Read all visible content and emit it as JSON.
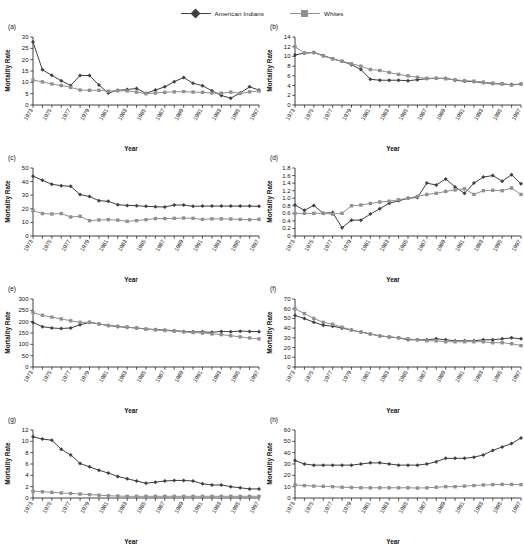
{
  "legend": {
    "entries": [
      {
        "label": "American Indians",
        "marker": "diamond",
        "color": "#3f3f46"
      },
      {
        "label": "Whites",
        "marker": "square",
        "color": "#8f8f96"
      }
    ]
  },
  "axis_titles": {
    "y": "Mortality Rate",
    "x": "Year"
  },
  "years": [
    1973,
    1974,
    1975,
    1976,
    1977,
    1978,
    1979,
    1980,
    1981,
    1982,
    1983,
    1984,
    1985,
    1986,
    1987,
    1988,
    1989,
    1990,
    1991,
    1992,
    1993,
    1994,
    1995,
    1996,
    1997
  ],
  "xtick_labels": [
    "1973",
    "1975",
    "1977",
    "1979",
    "1981",
    "1983",
    "1985",
    "1987",
    "1989",
    "1991",
    "1993",
    "1995",
    "1997"
  ],
  "chart_data": [
    {
      "type": "line",
      "tag": "(a)",
      "title": "",
      "xlabel": "Year",
      "ylabel": "Mortality Rate",
      "grid": false,
      "legend_position": "top-center",
      "xlim": [
        1973,
        1997
      ],
      "ylim": [
        0,
        30
      ],
      "yticks": [
        0,
        5,
        10,
        15,
        20,
        25,
        30
      ],
      "ytick_labels": [
        "0",
        "5",
        "10",
        "15",
        "20",
        "25",
        "30"
      ],
      "x": [
        1973,
        1974,
        1975,
        1976,
        1977,
        1978,
        1979,
        1980,
        1981,
        1982,
        1983,
        1984,
        1985,
        1986,
        1987,
        1988,
        1989,
        1990,
        1991,
        1992,
        1993,
        1994,
        1995,
        1996,
        1997
      ],
      "series": [
        {
          "name": "American Indians",
          "values": [
            27.8,
            15.5,
            13.1,
            10.7,
            8.6,
            13.0,
            13.0,
            8.8,
            5.3,
            6.5,
            6.8,
            7.3,
            5.2,
            6.6,
            8.0,
            10.3,
            12.1,
            9.6,
            8.5,
            6.3,
            4.2,
            3.0,
            5.3,
            8.0,
            6.6
          ]
        },
        {
          "name": "Whites",
          "values": [
            11.0,
            10.2,
            9.3,
            8.6,
            7.8,
            6.6,
            6.5,
            6.5,
            6.1,
            6.3,
            6.2,
            5.7,
            5.0,
            5.3,
            5.6,
            5.8,
            5.9,
            5.7,
            5.6,
            5.3,
            5.2,
            5.7,
            5.1,
            5.8,
            6.2
          ]
        }
      ]
    },
    {
      "type": "line",
      "tag": "(b)",
      "title": "",
      "xlabel": "Year",
      "ylabel": "Mortality Rate",
      "grid": false,
      "legend_position": "top-center",
      "xlim": [
        1973,
        1997
      ],
      "ylim": [
        0,
        14
      ],
      "yticks": [
        0,
        2,
        4,
        6,
        8,
        10,
        12,
        14
      ],
      "ytick_labels": [
        "0",
        "2",
        "4",
        "6",
        "8",
        "10",
        "12",
        "14"
      ],
      "x": [
        1973,
        1974,
        1975,
        1976,
        1977,
        1978,
        1979,
        1980,
        1981,
        1982,
        1983,
        1984,
        1985,
        1986,
        1987,
        1988,
        1989,
        1990,
        1991,
        1992,
        1993,
        1994,
        1995,
        1996,
        1997
      ],
      "series": [
        {
          "name": "American Indians",
          "values": [
            10.3,
            10.7,
            10.8,
            10.2,
            9.5,
            9.0,
            8.3,
            7.3,
            5.3,
            5.1,
            5.1,
            5.1,
            5.0,
            5.2,
            5.4,
            5.5,
            5.5,
            5.1,
            4.9,
            4.8,
            4.6,
            4.4,
            4.3,
            4.2,
            4.3
          ]
        },
        {
          "name": "Whites",
          "values": [
            12.0,
            10.7,
            10.8,
            10.1,
            9.5,
            9.0,
            8.5,
            8.0,
            7.3,
            7.1,
            6.7,
            6.3,
            6.0,
            5.7,
            5.5,
            5.5,
            5.4,
            5.2,
            5.0,
            4.9,
            4.7,
            4.5,
            4.4,
            4.1,
            4.3
          ]
        }
      ]
    },
    {
      "type": "line",
      "tag": "(c)",
      "title": "",
      "xlabel": "Year",
      "ylabel": "Mortality Rate",
      "grid": false,
      "legend_position": "top-center",
      "xlim": [
        1973,
        1997
      ],
      "ylim": [
        0,
        50
      ],
      "yticks": [
        0,
        10,
        20,
        30,
        40,
        50
      ],
      "ytick_labels": [
        "0",
        "10",
        "20",
        "30",
        "40",
        "50"
      ],
      "x": [
        1973,
        1974,
        1975,
        1976,
        1977,
        1978,
        1979,
        1980,
        1981,
        1982,
        1983,
        1984,
        1985,
        1986,
        1987,
        1988,
        1989,
        1990,
        1991,
        1992,
        1993,
        1994,
        1995,
        1996,
        1997
      ],
      "series": [
        {
          "name": "American Indians",
          "values": [
            44.0,
            41.0,
            38.0,
            37.0,
            36.5,
            30.5,
            29.0,
            26.0,
            25.5,
            23.0,
            22.5,
            22.3,
            21.8,
            21.5,
            21.3,
            22.8,
            22.8,
            21.8,
            22.0,
            22.0,
            22.0,
            22.0,
            22.0,
            22.0,
            21.8
          ]
        },
        {
          "name": "Whites",
          "values": [
            18.7,
            16.5,
            16.2,
            16.5,
            14.0,
            14.5,
            11.3,
            11.8,
            12.0,
            11.7,
            10.8,
            11.3,
            12.0,
            12.8,
            12.8,
            13.0,
            13.2,
            13.0,
            12.2,
            12.6,
            12.6,
            12.5,
            12.2,
            12.0,
            12.3
          ]
        }
      ]
    },
    {
      "type": "line",
      "tag": "(d)",
      "title": "",
      "xlabel": "Year",
      "ylabel": "Mortality Rate",
      "grid": false,
      "legend_position": "top-center",
      "xlim": [
        1973,
        1997
      ],
      "ylim": [
        0,
        1.8
      ],
      "yticks": [
        0,
        0.2,
        0.4,
        0.6,
        0.8,
        1.0,
        1.2,
        1.4,
        1.6,
        1.8
      ],
      "ytick_labels": [
        "0",
        "0.2",
        "0.4",
        "0.6",
        "0.8",
        "1.0",
        "1.2",
        "1.4",
        "1.6",
        "1.8"
      ],
      "x": [
        1973,
        1974,
        1975,
        1976,
        1977,
        1978,
        1979,
        1980,
        1981,
        1982,
        1983,
        1984,
        1985,
        1986,
        1987,
        1988,
        1989,
        1990,
        1991,
        1992,
        1993,
        1994,
        1995,
        1996,
        1997
      ],
      "series": [
        {
          "name": "American Indians",
          "values": [
            0.82,
            0.68,
            0.81,
            0.6,
            0.62,
            0.22,
            0.42,
            0.42,
            0.58,
            0.72,
            0.87,
            0.93,
            1.0,
            1.02,
            1.4,
            1.35,
            1.51,
            1.3,
            1.13,
            1.4,
            1.56,
            1.6,
            1.45,
            1.62,
            1.38
          ]
        },
        {
          "name": "Whites",
          "values": [
            0.6,
            0.6,
            0.6,
            0.6,
            0.58,
            0.6,
            0.8,
            0.82,
            0.86,
            0.9,
            0.92,
            0.96,
            1.0,
            1.05,
            1.1,
            1.13,
            1.18,
            1.22,
            1.25,
            1.1,
            1.2,
            1.21,
            1.2,
            1.27,
            1.1
          ]
        }
      ]
    },
    {
      "type": "line",
      "tag": "(e)",
      "title": "",
      "xlabel": "Year",
      "ylabel": "Mortality Rate",
      "grid": false,
      "legend_position": "top-center",
      "xlim": [
        1973,
        1997
      ],
      "ylim": [
        0,
        300
      ],
      "yticks": [
        0,
        50,
        100,
        150,
        200,
        250,
        300
      ],
      "ytick_labels": [
        "0",
        "50",
        "100",
        "150",
        "200",
        "250",
        "300"
      ],
      "x": [
        1973,
        1974,
        1975,
        1976,
        1977,
        1978,
        1979,
        1980,
        1981,
        1982,
        1983,
        1984,
        1985,
        1986,
        1987,
        1988,
        1989,
        1990,
        1991,
        1992,
        1993,
        1994,
        1995,
        1996,
        1997
      ],
      "series": [
        {
          "name": "American Indians",
          "values": [
            196,
            178,
            172,
            170,
            172,
            186,
            197,
            190,
            183,
            178,
            175,
            172,
            168,
            165,
            163,
            160,
            157,
            155,
            155,
            153,
            157,
            156,
            158,
            157,
            156
          ]
        },
        {
          "name": "Whites",
          "values": [
            240,
            228,
            220,
            212,
            204,
            197,
            197,
            190,
            183,
            180,
            176,
            172,
            167,
            164,
            161,
            158,
            155,
            152,
            150,
            146,
            143,
            138,
            133,
            128,
            124
          ]
        }
      ]
    },
    {
      "type": "line",
      "tag": "(f)",
      "title": "",
      "xlabel": "Year",
      "ylabel": "Mortality Rate",
      "grid": false,
      "legend_position": "top-center",
      "xlim": [
        1973,
        1997
      ],
      "ylim": [
        0,
        70
      ],
      "yticks": [
        0,
        10,
        20,
        30,
        40,
        50,
        60,
        70
      ],
      "ytick_labels": [
        "0",
        "10",
        "20",
        "30",
        "40",
        "50",
        "60",
        "70"
      ],
      "x": [
        1973,
        1974,
        1975,
        1976,
        1977,
        1978,
        1979,
        1980,
        1981,
        1982,
        1983,
        1984,
        1985,
        1986,
        1987,
        1988,
        1989,
        1990,
        1991,
        1992,
        1993,
        1994,
        1995,
        1996,
        1997
      ],
      "series": [
        {
          "name": "American Indians",
          "values": [
            53,
            50,
            46,
            43,
            42,
            40,
            38,
            36,
            34,
            32,
            31,
            30,
            28,
            28,
            28,
            29,
            28,
            27,
            27,
            27,
            28,
            28,
            29,
            30,
            29
          ]
        },
        {
          "name": "Whites",
          "values": [
            60,
            55,
            50,
            46,
            44,
            41,
            38,
            36,
            34,
            32,
            31,
            30,
            29,
            28,
            27,
            27,
            26,
            26,
            26,
            26,
            26,
            25,
            25,
            24,
            22
          ]
        }
      ]
    },
    {
      "type": "line",
      "tag": "(g)",
      "title": "",
      "xlabel": "Year",
      "ylabel": "Mortality Rate",
      "grid": false,
      "legend_position": "top-center",
      "xlim": [
        1973,
        1997
      ],
      "ylim": [
        0,
        12
      ],
      "yticks": [
        0,
        2,
        4,
        6,
        8,
        10,
        12
      ],
      "ytick_labels": [
        "0",
        "2",
        "4",
        "6",
        "8",
        "10",
        "12"
      ],
      "x": [
        1973,
        1974,
        1975,
        1976,
        1977,
        1978,
        1979,
        1980,
        1981,
        1982,
        1983,
        1984,
        1985,
        1986,
        1987,
        1988,
        1989,
        1990,
        1991,
        1992,
        1993,
        1994,
        1995,
        1996,
        1997
      ],
      "series": [
        {
          "name": "American Indians",
          "values": [
            10.8,
            10.4,
            10.2,
            8.6,
            7.6,
            6.1,
            5.5,
            4.9,
            4.4,
            3.8,
            3.4,
            3.0,
            2.6,
            2.8,
            3.0,
            3.1,
            3.1,
            3.0,
            2.5,
            2.3,
            2.3,
            2.0,
            1.8,
            1.6,
            1.6
          ]
        },
        {
          "name": "Whites",
          "values": [
            1.2,
            1.1,
            1.0,
            0.9,
            0.8,
            0.7,
            0.6,
            0.5,
            0.4,
            0.35,
            0.3,
            0.3,
            0.3,
            0.3,
            0.3,
            0.3,
            0.3,
            0.3,
            0.3,
            0.3,
            0.3,
            0.3,
            0.3,
            0.3,
            0.3
          ]
        }
      ]
    },
    {
      "type": "line",
      "tag": "(h)",
      "title": "",
      "xlabel": "Year",
      "ylabel": "Mortality Rate",
      "grid": false,
      "legend_position": "top-center",
      "xlim": [
        1973,
        1997
      ],
      "ylim": [
        0,
        60
      ],
      "yticks": [
        0,
        10,
        20,
        30,
        40,
        50,
        60
      ],
      "ytick_labels": [
        "0",
        "10",
        "20",
        "30",
        "40",
        "50",
        "60"
      ],
      "x": [
        1973,
        1974,
        1975,
        1976,
        1977,
        1978,
        1979,
        1980,
        1981,
        1982,
        1983,
        1984,
        1985,
        1986,
        1987,
        1988,
        1989,
        1990,
        1991,
        1992,
        1993,
        1994,
        1995,
        1996,
        1997
      ],
      "series": [
        {
          "name": "American Indians",
          "values": [
            33,
            30,
            29,
            29,
            29,
            29,
            29,
            30,
            31,
            31,
            30,
            29,
            29,
            29,
            30,
            32,
            35,
            35,
            35,
            36,
            38,
            42,
            45,
            48,
            53
          ]
        },
        {
          "name": "Whites",
          "values": [
            11.5,
            11,
            10.5,
            10.3,
            10,
            9.5,
            9.3,
            9,
            9,
            9,
            9,
            9,
            9,
            8.8,
            9,
            9.5,
            10,
            10,
            10.5,
            11,
            11.5,
            11.8,
            12,
            12,
            11.8
          ]
        }
      ]
    }
  ]
}
